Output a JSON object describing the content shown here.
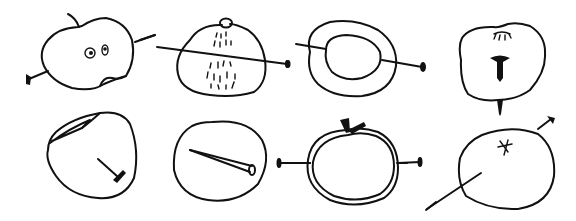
{
  "illustration": {
    "background": "#ffffff",
    "ink_color": "#111111",
    "panels": [
      {
        "id": 1,
        "description": "apple with face (two eyes, bitten mouth), stem, pierced by nail"
      },
      {
        "id": 2,
        "description": "peach-like fruit with top bump and stippled dashes, pierced horizontally by nail"
      },
      {
        "id": 3,
        "description": "double-ring cross-section of fruit pierced by nail"
      },
      {
        "id": 4,
        "description": "apple seen from top with calyx, nail head inside, nail tip protruding below"
      },
      {
        "id": 5,
        "description": "apple with cut wedge and nail stuck in side"
      },
      {
        "id": 6,
        "description": "circle containing a long nail"
      },
      {
        "id": 7,
        "description": "tomato with stem leaves, double outline, pierced horizontally by nail"
      },
      {
        "id": 8,
        "description": "round fruit with star calyx, nail through it diagonally"
      }
    ]
  }
}
